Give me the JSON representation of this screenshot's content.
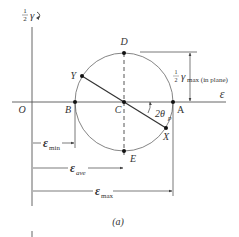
{
  "figure": {
    "caption": "(a)",
    "axes": {
      "horizontal_label": "ε",
      "vertical_label_frac": "1",
      "vertical_label_den": "2",
      "vertical_label_sym": "γ",
      "origin_label": "O"
    },
    "points": {
      "A": "A",
      "B": "B",
      "C": "C",
      "D": "D",
      "E": "E",
      "X": "X",
      "Y": "Y"
    },
    "angle_label": "2θ",
    "angle_sub": "p",
    "dimensions": {
      "gamma_max_frac_num": "1",
      "gamma_max_frac_den": "2",
      "gamma_max_sym": "γ",
      "gamma_max_sub": "max (in plane)",
      "eps_min_sym": "ε",
      "eps_min_sub": "min",
      "eps_ave_sym": "ε",
      "eps_ave_sub": "ave",
      "eps_max_sym": "ε",
      "eps_max_sub": "max"
    },
    "colors": {
      "line": "#555555",
      "text": "#333333",
      "background": "#ffffff"
    }
  }
}
